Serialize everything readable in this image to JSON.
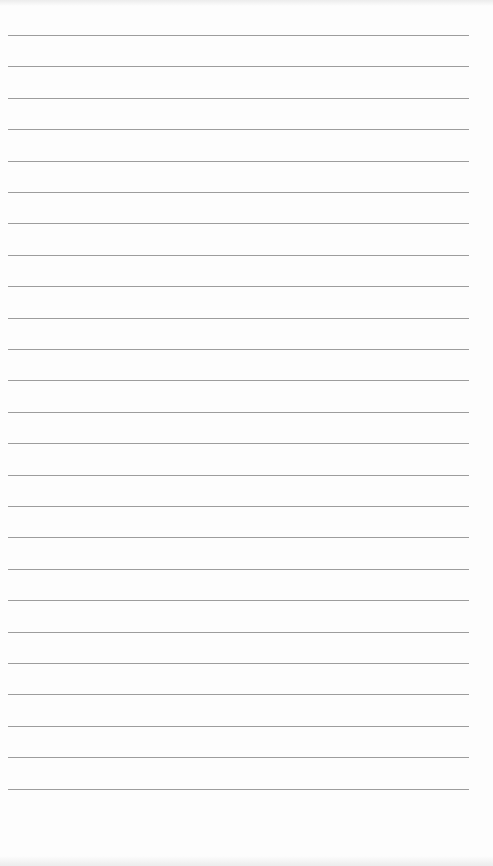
{
  "page": {
    "type": "lined-paper",
    "background_color": "#fdfdfd",
    "line_color": "#8c8c8c",
    "line_count": 25,
    "first_line_y": 35,
    "line_spacing": 31.4,
    "line_left": 8,
    "line_width": 461
  }
}
